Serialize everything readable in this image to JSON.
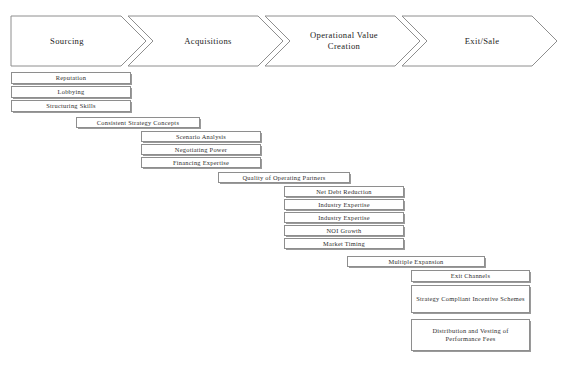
{
  "diagram": {
    "title_alt": "Private equity value creation chain",
    "accent_border": "#8e8e8e",
    "text_color": "#2e2e2e",
    "background": "#ffffff"
  },
  "stages": [
    {
      "label": "Sourcing"
    },
    {
      "label": "Acquisitions"
    },
    {
      "label": "Operational Value\nCreation"
    },
    {
      "label": "Exit/Sale"
    }
  ],
  "groups": [
    {
      "name": "sourcing-drivers",
      "items": [
        {
          "label": "Reputation"
        },
        {
          "label": "Lobbying"
        },
        {
          "label": "Structuring Skills"
        }
      ]
    },
    {
      "name": "acquisitions-header",
      "items": [
        {
          "label": "Consistent Strategy Concepts"
        }
      ]
    },
    {
      "name": "acquisitions-drivers",
      "items": [
        {
          "label": "Scenario Analysis"
        },
        {
          "label": "Negotiating Power"
        },
        {
          "label": "Financing Expertise"
        }
      ]
    },
    {
      "name": "operational-header",
      "items": [
        {
          "label": "Quality of Operating Partners"
        }
      ]
    },
    {
      "name": "operational-drivers",
      "items": [
        {
          "label": "Net Debt Reduction"
        },
        {
          "label": "Industry Expertise"
        },
        {
          "label": "Industry Expertise"
        },
        {
          "label": "NOI Growth"
        },
        {
          "label": "Market Timing"
        }
      ]
    },
    {
      "name": "exit-header",
      "items": [
        {
          "label": "Multiple Expansion"
        }
      ]
    },
    {
      "name": "exit-drivers",
      "items": [
        {
          "label": "Exit Channels"
        },
        {
          "label": "Strategy Compliant Incentive Schemes"
        },
        {
          "label": "Distribution and Vesting of\nPerformance Fees"
        }
      ]
    }
  ]
}
